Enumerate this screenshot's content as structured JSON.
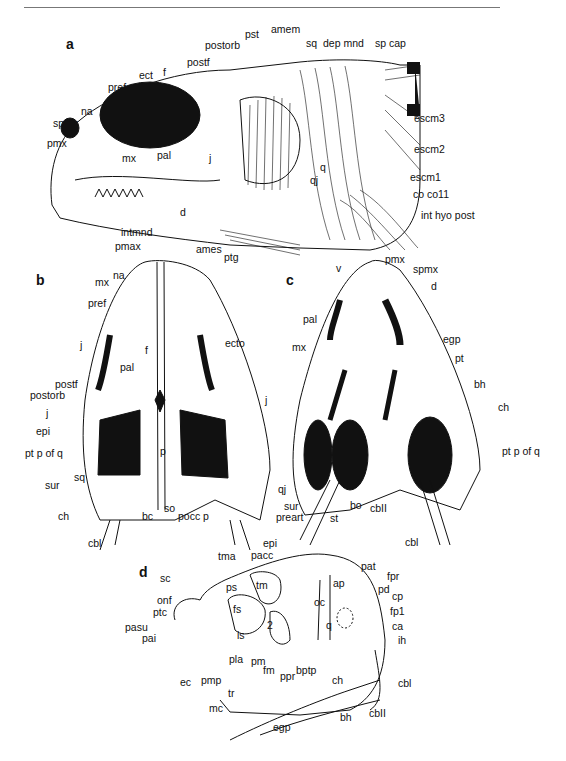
{
  "figure": {
    "panels": {
      "a": {
        "letter": "a",
        "view": "lateral head with musculature",
        "labels": [
          "pst",
          "amem",
          "postorb",
          "sq",
          "dep mnd",
          "sp cap",
          "postf",
          "ect",
          "f",
          "pref",
          "na",
          "spmx",
          "pmx",
          "pal",
          "mx",
          "j",
          "q",
          "qj",
          "escm3",
          "escm2",
          "escm1",
          "co co11",
          "int hyo post",
          "d",
          "intmnd",
          "ames",
          "ptg"
        ]
      },
      "b": {
        "letter": "b",
        "view": "dorsal skull",
        "labels": [
          "pmax",
          "na",
          "mx",
          "pref",
          "j",
          "f",
          "pal",
          "ecto",
          "postf",
          "postorb",
          "j",
          "epi",
          "p",
          "pt p of q",
          "sq",
          "sur",
          "ch",
          "bc",
          "so",
          "pocc p",
          "cbl",
          "j"
        ]
      },
      "c": {
        "letter": "c",
        "view": "ventral skull",
        "labels": [
          "pmx",
          "v",
          "spmx",
          "d",
          "pal",
          "mx",
          "egp",
          "pt",
          "bh",
          "ch",
          "pt p of q",
          "qj",
          "sur",
          "preart",
          "st",
          "bo",
          "cbII",
          "cbl"
        ]
      },
      "d": {
        "letter": "d",
        "view": "lateral braincase and hyoid",
        "labels": [
          "tma",
          "epi",
          "pacc",
          "pat",
          "sc",
          "ps",
          "tm",
          "fpr",
          "ap",
          "pd",
          "cp",
          "onf",
          "fs",
          "oc",
          "fp1",
          "ptc",
          "2",
          "ca",
          "pasu",
          "is",
          "q",
          "ih",
          "pai",
          "pla",
          "pm",
          "fm",
          "ppr",
          "bptp",
          "ec",
          "pmp",
          "tr",
          "ch",
          "cbl",
          "mc",
          "bh",
          "cbII",
          "egp"
        ]
      }
    }
  }
}
